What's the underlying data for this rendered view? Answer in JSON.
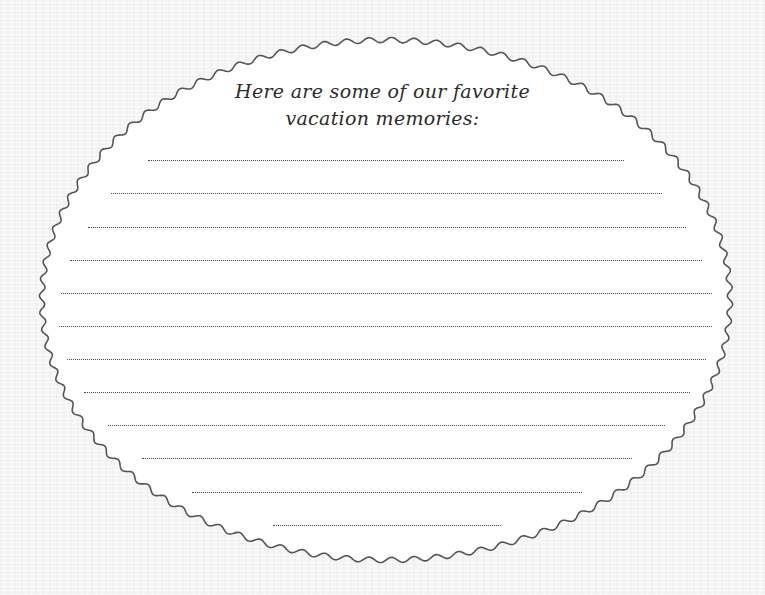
{
  "card": {
    "title_line1": "Here are some of our favorite",
    "title_line2": "vacation memories:",
    "frame_color": "#555555",
    "fill_color": "#ffffff",
    "dotted_color": "#4a4a4a"
  },
  "lines": [
    {
      "y": 160,
      "x1": 148,
      "x2": 624
    },
    {
      "y": 193,
      "x1": 111,
      "x2": 662
    },
    {
      "y": 227,
      "x1": 88,
      "x2": 686
    },
    {
      "y": 260,
      "x1": 70,
      "x2": 702
    },
    {
      "y": 293,
      "x1": 61,
      "x2": 712
    },
    {
      "y": 326,
      "x1": 59,
      "x2": 712
    },
    {
      "y": 359,
      "x1": 67,
      "x2": 706
    },
    {
      "y": 392,
      "x1": 84,
      "x2": 690
    },
    {
      "y": 425,
      "x1": 108,
      "x2": 665
    },
    {
      "y": 458,
      "x1": 142,
      "x2": 632
    },
    {
      "y": 492,
      "x1": 192,
      "x2": 582
    },
    {
      "y": 525,
      "x1": 273,
      "x2": 501
    }
  ]
}
